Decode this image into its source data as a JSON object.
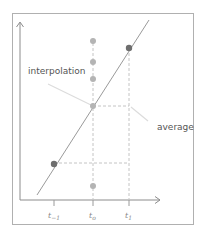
{
  "diagram": {
    "labels": {
      "interpolation": "interpolation",
      "average": "average"
    },
    "ticks": [
      {
        "label_main": "t",
        "label_sub": "−1",
        "x": 54
      },
      {
        "label_main": "t",
        "label_sub": "o",
        "x": 93
      },
      {
        "label_main": "t",
        "label_sub": "1",
        "x": 129
      }
    ],
    "colors": {
      "frame": "#b0b0b0",
      "axis": "#8c8c8c",
      "line": "#9a9a9a",
      "dark_point": "#6e6e6e",
      "light_point": "#b4b4b4",
      "dashed": "#c4c4c4",
      "leader": "#dcdcdc",
      "text": "#555555"
    },
    "points": {
      "dark": [
        {
          "x": 54,
          "y": 164
        },
        {
          "x": 129,
          "y": 48
        }
      ],
      "light": [
        {
          "x": 93,
          "y": 41
        },
        {
          "x": 93,
          "y": 62
        },
        {
          "x": 93,
          "y": 79
        },
        {
          "x": 93,
          "y": 106
        },
        {
          "x": 93,
          "y": 186
        }
      ]
    }
  }
}
